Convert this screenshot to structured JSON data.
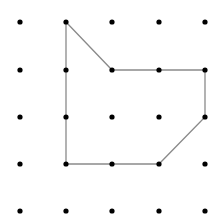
{
  "diagram": {
    "type": "dot-grid-polygon",
    "grid": {
      "columns": 5,
      "rows": 5,
      "x_positions": [
        20,
        66,
        112,
        159,
        205
      ],
      "y_positions": [
        22,
        70,
        117,
        164,
        211
      ],
      "dot_radius": 2.6,
      "dot_color": "#000000"
    },
    "polygon": {
      "vertices_grid": [
        [
          1,
          0
        ],
        [
          2,
          1
        ],
        [
          4,
          1
        ],
        [
          4,
          2
        ],
        [
          3,
          3
        ],
        [
          1,
          3
        ]
      ],
      "stroke_color": "#8a8a8a",
      "stroke_width": 1.3,
      "closed": true
    }
  }
}
